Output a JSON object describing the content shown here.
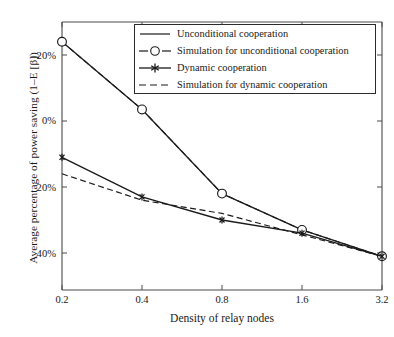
{
  "chart_data": {
    "type": "line",
    "title": "",
    "xlabel": "Density of relay nodes",
    "ylabel": "Average percentage of power saving (1–E [β])",
    "x": [
      0.2,
      0.4,
      0.8,
      1.6,
      3.2
    ],
    "xtick_labels": [
      "0.2",
      "0.4",
      "0.8",
      "1.6",
      "3.2"
    ],
    "ytick_labels": [
      "–20%",
      "0%",
      "20%",
      "40%"
    ],
    "ytick_values": [
      -20,
      0,
      20,
      40
    ],
    "ylim": [
      -29,
      48
    ],
    "y_axis_inverted": true,
    "grid": false,
    "legend_position": "top-right-inside",
    "series": [
      {
        "name": "Unconditional cooperation",
        "style": "solid",
        "marker": "none",
        "values": [
          -24,
          -3.5,
          22,
          33,
          41
        ]
      },
      {
        "name": "Simulation for unconditional cooperation",
        "style": "dashed",
        "marker": "circle-open",
        "values": [
          -24,
          -3.5,
          22,
          33,
          41
        ]
      },
      {
        "name": "Dynamic cooperation",
        "style": "solid",
        "marker": "asterisk",
        "values": [
          11,
          23,
          30,
          34,
          41
        ]
      },
      {
        "name": "Simulation for dynamic cooperation",
        "style": "dashed",
        "marker": "none",
        "values": [
          16,
          24,
          28,
          34.5,
          41
        ]
      }
    ]
  },
  "legend": {
    "entries": [
      {
        "label": "Unconditional cooperation"
      },
      {
        "label": "Simulation for unconditional cooperation"
      },
      {
        "label": "Dynamic cooperation"
      },
      {
        "label": "Simulation for dynamic cooperation"
      }
    ]
  },
  "colors": {
    "line": "#1a1a1a",
    "axis": "#3d3d3d",
    "background": "#ffffff"
  }
}
